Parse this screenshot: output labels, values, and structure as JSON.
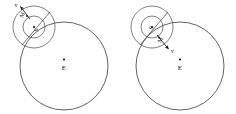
{
  "figure": {
    "background_color": "#ffffff",
    "line_color": "#3a3a3a",
    "label_color": "#111111",
    "width": 236,
    "height": 114
  },
  "panels": [
    {
      "id": "left-panel",
      "name": "panel-left",
      "earth_orbit": {
        "label": "",
        "cx": 64,
        "cy": 66,
        "r": 44
      },
      "earth": {
        "label": "E",
        "dot_x": 64,
        "dot_y": 60,
        "label_x": 64,
        "label_y": 70
      },
      "moon_outer_orbit": {
        "cx": 34,
        "cy": 27,
        "r": 21
      },
      "moon_inner_orbit": {
        "cx": 34,
        "cy": 27,
        "r": 11
      },
      "sun": {
        "label": "S",
        "dot_x": 34,
        "dot_y": 27,
        "label_x": 37,
        "label_y": 30,
        "label_rotation": -62
      },
      "moon": {
        "label": "M",
        "dot_x": 27,
        "dot_y": 16,
        "label_x": 24,
        "label_y": 15,
        "label_rotation": -62
      },
      "velocity_arrow": {
        "label": "v",
        "from_x": 30,
        "from_y": 19,
        "to_x": 19,
        "to_y": 5,
        "label_x": 16,
        "label_y": 6,
        "direction": "up-left"
      },
      "radius_line": {
        "from_x": 22,
        "from_y": 45,
        "to_x": 50,
        "to_y": 12
      }
    },
    {
      "id": "right-panel",
      "name": "panel-right",
      "earth_orbit": {
        "label": "",
        "cx": 180,
        "cy": 66,
        "r": 44
      },
      "earth": {
        "label": "E",
        "dot_x": 180,
        "dot_y": 60,
        "label_x": 180,
        "label_y": 70
      },
      "moon_outer_orbit": {
        "cx": 152,
        "cy": 27,
        "r": 21
      },
      "moon_inner_orbit": {
        "cx": 152,
        "cy": 27,
        "r": 11
      },
      "sun": {
        "label": "S",
        "dot_x": 152,
        "dot_y": 27,
        "label_x": 152,
        "label_y": 28,
        "label_rotation": -62
      },
      "moon": {
        "label": "M",
        "dot_x": 159,
        "dot_y": 38,
        "label_x": 161,
        "label_y": 40,
        "label_rotation": -62
      },
      "velocity_arrow": {
        "label": "v",
        "from_x": 157,
        "from_y": 35,
        "to_x": 170,
        "to_y": 51,
        "label_x": 172,
        "label_y": 52,
        "direction": "down-right"
      },
      "radius_line": {
        "from_x": 140,
        "from_y": 45,
        "to_x": 168,
        "to_y": 12
      }
    }
  ]
}
